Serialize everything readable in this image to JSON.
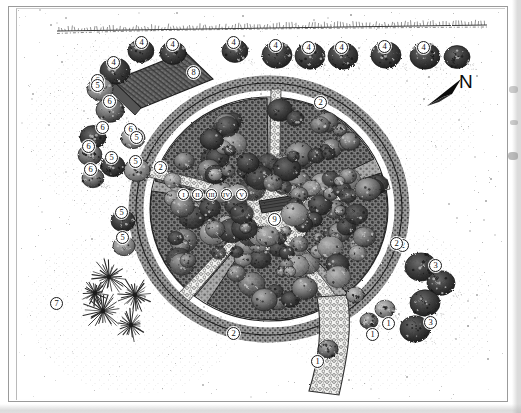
{
  "figure": {
    "kind": "garden-plan-illustration",
    "medium": "pen-and-ink stipple drawing",
    "background_color": "#ffffff",
    "ink_color": "#1a1a1a",
    "frame_color": "#9a9a9a"
  },
  "compass": {
    "label": "N",
    "direction": "up-left",
    "arrow_name": "north-arrow"
  },
  "legend_keys": [
    {
      "id": "1",
      "count": 4
    },
    {
      "id": "2",
      "count": 5
    },
    {
      "id": "3",
      "count": 2
    },
    {
      "id": "4",
      "count": 10
    },
    {
      "id": "5",
      "count": 7
    },
    {
      "id": "6",
      "count": 6
    },
    {
      "id": "7",
      "count": 1
    },
    {
      "id": "8",
      "count": 1
    },
    {
      "id": "9",
      "count": 1
    }
  ],
  "roman_markers": [
    "I",
    "II",
    "III",
    "IV",
    "V"
  ],
  "markers": [
    {
      "name": "marker-4-a",
      "label": "4",
      "x": 124,
      "y": 33
    },
    {
      "name": "marker-4-b",
      "label": "4",
      "x": 155,
      "y": 35
    },
    {
      "name": "marker-4-c",
      "label": "4",
      "x": 216,
      "y": 33
    },
    {
      "name": "marker-4-d",
      "label": "4",
      "x": 258,
      "y": 36
    },
    {
      "name": "marker-4-e",
      "label": "4",
      "x": 291,
      "y": 38
    },
    {
      "name": "marker-4-f",
      "label": "4",
      "x": 324,
      "y": 38
    },
    {
      "name": "marker-4-g",
      "label": "4",
      "x": 367,
      "y": 37
    },
    {
      "name": "marker-4-h",
      "label": "4",
      "x": 406,
      "y": 38
    },
    {
      "name": "marker-4-i",
      "label": "4",
      "x": 96,
      "y": 53
    },
    {
      "name": "marker-6-a",
      "label": "6",
      "x": 80,
      "y": 71
    },
    {
      "name": "marker-6-b",
      "label": "6",
      "x": 92,
      "y": 92
    },
    {
      "name": "marker-6-c",
      "label": "6",
      "x": 85,
      "y": 118
    },
    {
      "name": "marker-6-d",
      "label": "6",
      "x": 113,
      "y": 120
    },
    {
      "name": "marker-6-e",
      "label": "6",
      "x": 71,
      "y": 137
    },
    {
      "name": "marker-6-f",
      "label": "6",
      "x": 73,
      "y": 160
    },
    {
      "name": "marker-5-a",
      "label": "5",
      "x": 80,
      "y": 76
    },
    {
      "name": "marker-5-b",
      "label": "5",
      "x": 119,
      "y": 128
    },
    {
      "name": "marker-5-c",
      "label": "5",
      "x": 94,
      "y": 148
    },
    {
      "name": "marker-5-d",
      "label": "5",
      "x": 118,
      "y": 152
    },
    {
      "name": "marker-5-e",
      "label": "5",
      "x": 104,
      "y": 203
    },
    {
      "name": "marker-5-f",
      "label": "5",
      "x": 105,
      "y": 228
    },
    {
      "name": "marker-8",
      "label": "8",
      "x": 176,
      "y": 63
    },
    {
      "name": "marker-9",
      "label": "9",
      "x": 257,
      "y": 210
    },
    {
      "name": "marker-2-a",
      "label": "2",
      "x": 303,
      "y": 93
    },
    {
      "name": "marker-2-b",
      "label": "2",
      "x": 143,
      "y": 158
    },
    {
      "name": "marker-2-c",
      "label": "2",
      "x": 385,
      "y": 236
    },
    {
      "name": "marker-2-d",
      "label": "2",
      "x": 216,
      "y": 324
    },
    {
      "name": "marker-2-e",
      "label": "2",
      "x": 379,
      "y": 234
    },
    {
      "name": "marker-3-a",
      "label": "3",
      "x": 418,
      "y": 256
    },
    {
      "name": "marker-3-b",
      "label": "3",
      "x": 413,
      "y": 313
    },
    {
      "name": "marker-1-a",
      "label": "1",
      "x": 371,
      "y": 314
    },
    {
      "name": "marker-1-b",
      "label": "1",
      "x": 355,
      "y": 325
    },
    {
      "name": "marker-1-c",
      "label": "1",
      "x": 300,
      "y": 352
    },
    {
      "name": "marker-7",
      "label": "7",
      "x": 39,
      "y": 294
    }
  ],
  "roman_row": [
    {
      "name": "roman-marker-i",
      "label": "I",
      "x": 166,
      "y": 185
    },
    {
      "name": "roman-marker-ii",
      "label": "II",
      "x": 180,
      "y": 185
    },
    {
      "name": "roman-marker-iii",
      "label": "III",
      "x": 194,
      "y": 185
    },
    {
      "name": "roman-marker-iv",
      "label": "IV",
      "x": 209,
      "y": 185
    },
    {
      "name": "roman-marker-v",
      "label": "V",
      "x": 224,
      "y": 185
    }
  ],
  "features": {
    "circular_garden": "radial circular parterre with five wedge beds",
    "central_plaza": "cobbled circular plaza with bench",
    "paths": "cobblestone radiating walkways",
    "building": "rectangular hatched structure upper left",
    "hedgerow": "clipped shrub row along top boundary",
    "specimen_plants": "spiky yucca clump lower left",
    "boundary_line": "property boundary hedge line across top"
  }
}
